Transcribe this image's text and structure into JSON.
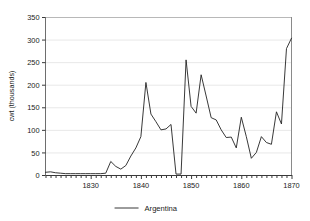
{
  "chart_data": {
    "type": "line",
    "title": "",
    "xlabel": "",
    "ylabel": "cwt (thousands)",
    "xlim": [
      1821,
      1870
    ],
    "ylim": [
      0,
      350
    ],
    "yticks": [
      0,
      50,
      100,
      150,
      200,
      250,
      300,
      350
    ],
    "ytick_labels": [
      "0",
      "50",
      "100",
      "150",
      "200",
      "250",
      "300",
      "350"
    ],
    "xticks": [
      1830,
      1840,
      1850,
      1860,
      1870
    ],
    "xtick_labels": [
      "1830",
      "1840",
      "1850",
      "1860",
      "1870"
    ],
    "xtick_minor_step": 1,
    "grid": "horizontal",
    "grid_color": "#e8e8e8",
    "legend_position": "bottom-center",
    "series": [
      {
        "name": "Argentina",
        "color": "#222222",
        "x": [
          1821,
          1822,
          1823,
          1824,
          1825,
          1826,
          1827,
          1828,
          1829,
          1830,
          1831,
          1832,
          1833,
          1834,
          1835,
          1836,
          1837,
          1838,
          1839,
          1840,
          1841,
          1842,
          1843,
          1844,
          1845,
          1846,
          1847,
          1848,
          1849,
          1850,
          1851,
          1852,
          1853,
          1854,
          1855,
          1856,
          1857,
          1858,
          1859,
          1860,
          1861,
          1862,
          1863,
          1864,
          1865,
          1866,
          1867,
          1868,
          1869,
          1870
        ],
        "values": [
          6,
          7,
          5,
          4,
          3,
          3,
          3,
          3,
          3,
          3,
          3,
          3,
          4,
          30,
          19,
          13,
          21,
          42,
          60,
          85,
          205,
          135,
          118,
          100,
          102,
          112,
          2,
          2,
          255,
          152,
          137,
          222,
          175,
          127,
          122,
          100,
          83,
          84,
          60,
          128,
          85,
          37,
          50,
          85,
          72,
          68,
          140,
          113,
          280,
          303
        ]
      }
    ]
  },
  "legend": {
    "entries": [
      {
        "label": "Argentina",
        "color": "#222222"
      }
    ]
  },
  "axes": {
    "y_title": "cwt (thousands)"
  }
}
